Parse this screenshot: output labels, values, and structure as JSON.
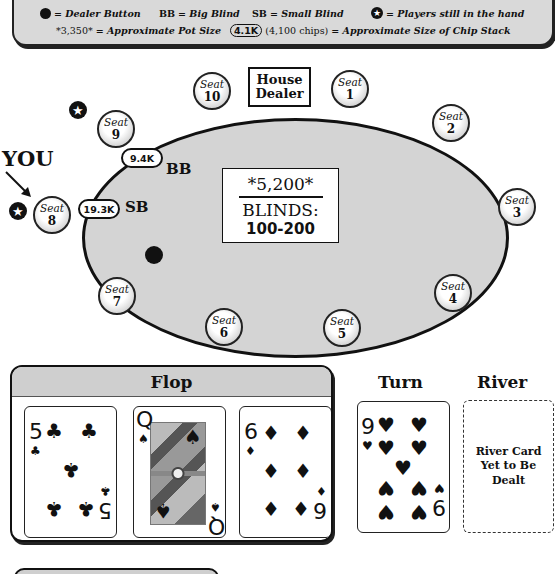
{
  "legend": {
    "row1": [
      {
        "icon": "dealer-button-icon",
        "text": "= Dealer Button"
      },
      {
        "abbr": "BB",
        "text": "= Big Blind"
      },
      {
        "abbr": "SB",
        "text": "= Small Blind"
      },
      {
        "icon": "star-icon",
        "text": "= Players still in the hand"
      }
    ],
    "row2": {
      "pot_example": "*3,350*",
      "pot_text": "= Approximate Pot Size",
      "chip_example": "4.1K",
      "chip_detail": "(4,100 chips)",
      "chip_text": "= Approximate Size of Chip Stack"
    }
  },
  "table": {
    "house_dealer": [
      "House",
      "Dealer"
    ],
    "seat_label": "Seat",
    "seats": [
      "1",
      "2",
      "3",
      "4",
      "5",
      "6",
      "7",
      "8",
      "9",
      "10"
    ],
    "you_label": "YOU",
    "pot": "*5,200*",
    "blinds_label": "BLINDS:",
    "blinds_value": "100-200",
    "big_blind": {
      "seat": "9",
      "tag": "BB",
      "stack": "9.4K"
    },
    "small_blind": {
      "seat": "8",
      "tag": "SB",
      "stack": "19.3K"
    },
    "players_in_hand": [
      "8",
      "9"
    ],
    "dealer_button_seat": "7"
  },
  "board": {
    "flop_title": "Flop",
    "turn_title": "Turn",
    "river_title": "River",
    "flop": [
      {
        "rank": "5",
        "suit": "♣",
        "suit_name": "clubs"
      },
      {
        "rank": "Q",
        "suit": "♠",
        "suit_name": "spades"
      },
      {
        "rank": "6",
        "suit": "♦",
        "suit_name": "diamonds"
      }
    ],
    "turn": {
      "rank": "9",
      "suit": "♥",
      "suit_name": "hearts"
    },
    "river_placeholder": "River Card Yet to Be Dealt"
  },
  "colors": {
    "table_felt": "#d4d4d4",
    "panel_header": "#cfcfcf",
    "ink": "#111111"
  }
}
